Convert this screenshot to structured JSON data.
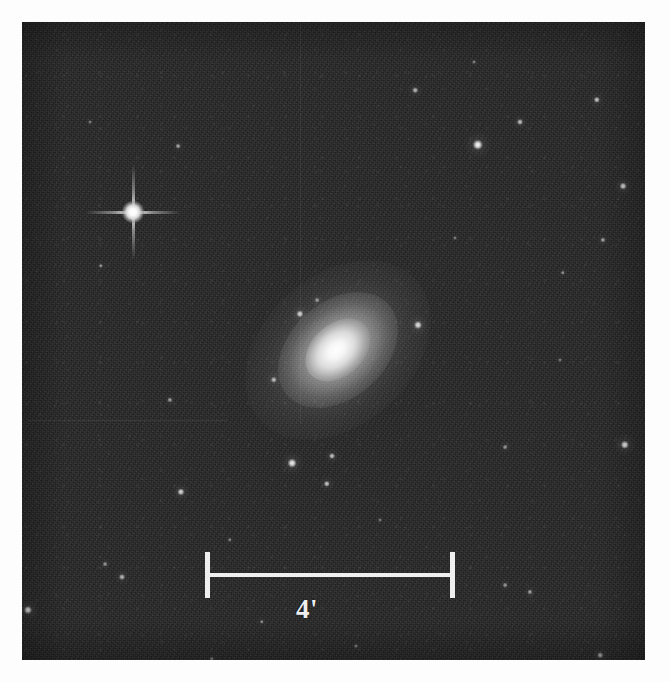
{
  "figure": {
    "kind": "astronomical-plate",
    "caption_text": "",
    "page_background": "#fdfdfd",
    "plate": {
      "x": 22,
      "y": 22,
      "width": 623,
      "height": 638,
      "sky_background": "#242424"
    }
  },
  "scale_bar": {
    "label": "4'",
    "value": 4,
    "unit": "arcmin",
    "unit_symbol": "'",
    "color": "#efefef",
    "x": 205,
    "y": 552,
    "length": 250,
    "tick_height": 46,
    "label_x": 307,
    "label_y": 596
  },
  "galaxy": {
    "name": "",
    "x": 338,
    "y": 350,
    "major_axis": 210,
    "minor_axis": 150,
    "position_angle_deg": -42,
    "morphology": "elliptical-lenticular",
    "color": "#ffffff"
  },
  "bright_star": {
    "x": 133,
    "y": 212,
    "diameter": 22,
    "spike_length": 96,
    "has_diffraction_spikes": true,
    "color": "#ffffff"
  },
  "stars": [
    {
      "x": 178,
      "y": 146,
      "r": 2.4,
      "b": 0.62
    },
    {
      "x": 101,
      "y": 266,
      "r": 2.2,
      "b": 0.55
    },
    {
      "x": 415,
      "y": 90,
      "r": 2.8,
      "b": 0.66
    },
    {
      "x": 478,
      "y": 145,
      "r": 5.2,
      "b": 0.98
    },
    {
      "x": 520,
      "y": 122,
      "r": 3.0,
      "b": 0.72
    },
    {
      "x": 597,
      "y": 100,
      "r": 3.2,
      "b": 0.74
    },
    {
      "x": 623,
      "y": 186,
      "r": 3.4,
      "b": 0.8
    },
    {
      "x": 603,
      "y": 240,
      "r": 2.6,
      "b": 0.6
    },
    {
      "x": 563,
      "y": 273,
      "r": 2.2,
      "b": 0.5
    },
    {
      "x": 300,
      "y": 314,
      "r": 3.6,
      "b": 0.82
    },
    {
      "x": 418,
      "y": 325,
      "r": 4.0,
      "b": 0.88
    },
    {
      "x": 274,
      "y": 380,
      "r": 3.2,
      "b": 0.7
    },
    {
      "x": 317,
      "y": 300,
      "r": 2.4,
      "b": 0.55
    },
    {
      "x": 170,
      "y": 400,
      "r": 2.6,
      "b": 0.58
    },
    {
      "x": 181,
      "y": 492,
      "r": 3.6,
      "b": 0.82
    },
    {
      "x": 292,
      "y": 463,
      "r": 4.4,
      "b": 0.92
    },
    {
      "x": 332,
      "y": 456,
      "r": 3.0,
      "b": 0.72
    },
    {
      "x": 327,
      "y": 484,
      "r": 3.2,
      "b": 0.74
    },
    {
      "x": 122,
      "y": 577,
      "r": 3.0,
      "b": 0.68
    },
    {
      "x": 105,
      "y": 564,
      "r": 2.4,
      "b": 0.52
    },
    {
      "x": 28,
      "y": 610,
      "r": 4.0,
      "b": 0.86
    },
    {
      "x": 625,
      "y": 445,
      "r": 4.2,
      "b": 0.9
    },
    {
      "x": 505,
      "y": 447,
      "r": 2.4,
      "b": 0.52
    },
    {
      "x": 505,
      "y": 585,
      "r": 2.4,
      "b": 0.52
    },
    {
      "x": 530,
      "y": 592,
      "r": 2.6,
      "b": 0.58
    },
    {
      "x": 600,
      "y": 655,
      "r": 2.8,
      "b": 0.62
    },
    {
      "x": 262,
      "y": 622,
      "r": 2.2,
      "b": 0.48
    },
    {
      "x": 356,
      "y": 646,
      "r": 2.0,
      "b": 0.44
    },
    {
      "x": 212,
      "y": 659,
      "r": 2.2,
      "b": 0.46
    },
    {
      "x": 474,
      "y": 62,
      "r": 2.0,
      "b": 0.44
    },
    {
      "x": 90,
      "y": 122,
      "r": 2.0,
      "b": 0.42
    },
    {
      "x": 560,
      "y": 360,
      "r": 2.0,
      "b": 0.4
    },
    {
      "x": 380,
      "y": 520,
      "r": 2.0,
      "b": 0.4
    },
    {
      "x": 230,
      "y": 540,
      "r": 2.2,
      "b": 0.46
    },
    {
      "x": 455,
      "y": 238,
      "r": 2.0,
      "b": 0.42
    }
  ],
  "artifacts": {
    "scanlines_horizontal": [
      {
        "x": 28,
        "y": 420,
        "width": 200
      }
    ],
    "scanlines_vertical": [
      {
        "x": 300,
        "y": 24,
        "height": 400
      }
    ]
  }
}
